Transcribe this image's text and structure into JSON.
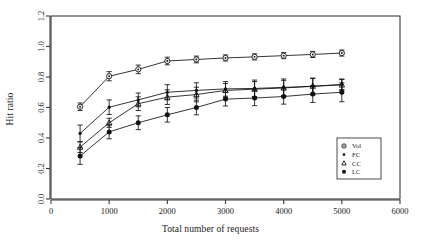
{
  "chart_data": {
    "type": "line",
    "title": "",
    "xlabel": "Total number of requests",
    "ylabel": "Hit ratio",
    "xlim": [
      0,
      6000
    ],
    "ylim": [
      0.0,
      1.2
    ],
    "xticks": [
      0,
      1000,
      2000,
      3000,
      4000,
      5000,
      6000
    ],
    "xtick_labels": [
      "0",
      "1000",
      "2000",
      "3000",
      "4000",
      "5000",
      "6000"
    ],
    "yticks": [
      0.0,
      0.2,
      0.4,
      0.6,
      0.8,
      1.0,
      1.2
    ],
    "ytick_labels": [
      "0.0",
      "0.2",
      "0.4",
      "0.6",
      "0.8",
      "1.0",
      "1.2"
    ],
    "grid": false,
    "legend_position": "bottom-right",
    "error_bars": true,
    "x": [
      500,
      1000,
      1500,
      2000,
      2500,
      3000,
      3500,
      4000,
      4500,
      5000
    ],
    "series": [
      {
        "name": "Vol",
        "marker": "circle-dot",
        "values": [
          0.605,
          0.805,
          0.85,
          0.905,
          0.915,
          0.925,
          0.932,
          0.94,
          0.948,
          0.957
        ],
        "errors": [
          0.025,
          0.03,
          0.028,
          0.025,
          0.022,
          0.02,
          0.02,
          0.02,
          0.02,
          0.02
        ]
      },
      {
        "name": "FC",
        "marker": "small-dot",
        "values": [
          0.43,
          0.602,
          0.65,
          0.7,
          0.712,
          0.722,
          0.725,
          0.732,
          0.738,
          0.752
        ],
        "errors": [
          0.055,
          0.048,
          0.045,
          0.05,
          0.05,
          0.048,
          0.055,
          0.055,
          0.055,
          0.035
        ]
      },
      {
        "name": "CC",
        "marker": "triangle",
        "values": [
          0.34,
          0.5,
          0.625,
          0.668,
          0.685,
          0.712,
          0.72,
          0.728,
          0.74,
          0.748
        ],
        "errors": [
          0.035,
          0.03,
          0.045,
          0.048,
          0.048,
          0.045,
          0.05,
          0.05,
          0.05,
          0.035
        ]
      },
      {
        "name": "LC",
        "marker": "filled-circle",
        "values": [
          0.282,
          0.44,
          0.5,
          0.552,
          0.6,
          0.655,
          0.662,
          0.672,
          0.688,
          0.7
        ],
        "errors": [
          0.055,
          0.045,
          0.045,
          0.048,
          0.048,
          0.045,
          0.05,
          0.05,
          0.055,
          0.062
        ]
      }
    ],
    "legend_entries": [
      {
        "label": "Vol",
        "marker": "circle-dot"
      },
      {
        "label": "FC",
        "marker": "small-dot"
      },
      {
        "label": "CC",
        "marker": "triangle"
      },
      {
        "label": "LC",
        "marker": "filled-circle"
      }
    ]
  }
}
